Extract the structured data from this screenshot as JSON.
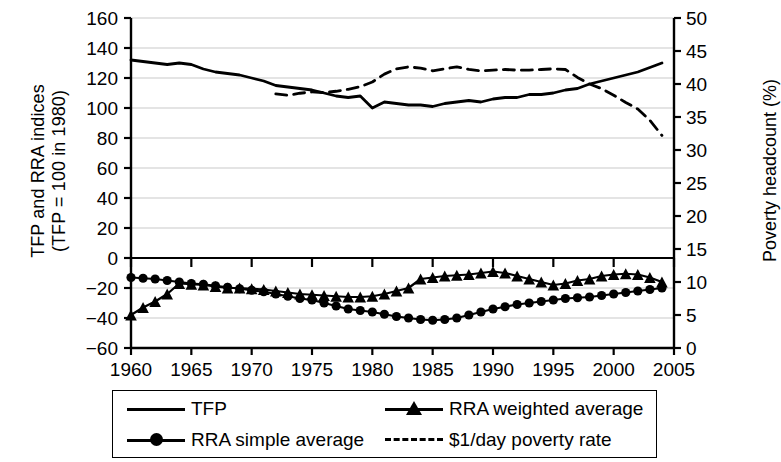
{
  "figure": {
    "axis_left_label": "TFP and RRA indices\n(TFP = 100 in 1980)",
    "axis_left_label_line1": "TFP and RRA indices",
    "axis_left_label_line2": "(TFP = 100 in 1980)",
    "axis_right_label": "Poverty headcount (%)"
  },
  "legend": {
    "items": [
      {
        "label": "TFP",
        "marker": "none",
        "dash": false
      },
      {
        "label": "RRA weighted average",
        "marker": "triangle",
        "dash": false
      },
      {
        "label": "RRA simple average",
        "marker": "circle",
        "dash": false
      },
      {
        "label": "$1/day poverty rate",
        "marker": "none",
        "dash": true
      }
    ]
  },
  "chart_data": {
    "type": "line",
    "title": "",
    "xlabel": "",
    "ylabel": "TFP and RRA indices (TFP = 100 in 1980)",
    "y2label": "Poverty headcount (%)",
    "xlim": [
      1960,
      2005
    ],
    "ylim": [
      -60,
      160
    ],
    "y2lim": [
      0,
      50
    ],
    "yticks": [
      -60,
      -40,
      -20,
      0,
      20,
      40,
      60,
      80,
      100,
      120,
      140,
      160
    ],
    "y2ticks": [
      0,
      5,
      10,
      15,
      20,
      25,
      30,
      35,
      40,
      45,
      50
    ],
    "xticks": [
      1960,
      1965,
      1970,
      1975,
      1980,
      1985,
      1990,
      1995,
      2000,
      2005
    ],
    "grid": true,
    "legend_position": "below",
    "series": [
      {
        "name": "TFP",
        "axis": "left",
        "style": "solid",
        "marker": "none",
        "color": "#000000",
        "x": [
          1960,
          1961,
          1962,
          1963,
          1964,
          1965,
          1966,
          1967,
          1968,
          1969,
          1970,
          1971,
          1972,
          1973,
          1974,
          1975,
          1976,
          1977,
          1978,
          1979,
          1980,
          1981,
          1982,
          1983,
          1984,
          1985,
          1986,
          1987,
          1988,
          1989,
          1990,
          1991,
          1992,
          1993,
          1994,
          1995,
          1996,
          1997,
          1998,
          1999,
          2000,
          2001,
          2002,
          2003,
          2004
        ],
        "y": [
          132,
          131,
          130,
          129,
          130,
          129,
          126,
          124,
          123,
          122,
          120,
          118,
          115,
          114,
          113,
          112,
          110,
          108,
          107,
          108,
          100,
          104,
          103,
          102,
          102,
          101,
          103,
          104,
          105,
          104,
          106,
          107,
          107,
          109,
          109,
          110,
          112,
          113,
          116,
          118,
          120,
          122,
          124,
          127,
          130
        ]
      },
      {
        "name": "$1/day poverty rate",
        "axis": "right",
        "style": "dashed",
        "marker": "none",
        "color": "#000000",
        "x": [
          1972,
          1973,
          1974,
          1975,
          1976,
          1977,
          1978,
          1979,
          1980,
          1981,
          1982,
          1983,
          1984,
          1985,
          1986,
          1987,
          1988,
          1989,
          1990,
          1991,
          1992,
          1993,
          1994,
          1995,
          1996,
          1997,
          1998,
          1999,
          2000,
          2001,
          2002,
          2003,
          2004
        ],
        "y": [
          38.5,
          38.3,
          38.6,
          38.8,
          38.7,
          38.9,
          39.2,
          39.6,
          40.3,
          41.5,
          42.3,
          42.6,
          42.4,
          42.0,
          42.3,
          42.6,
          42.2,
          42.0,
          42.1,
          42.2,
          42.1,
          42.1,
          42.2,
          42.3,
          42.2,
          41.0,
          40.0,
          39.3,
          38.3,
          37.2,
          36.2,
          34.5,
          32.2
        ]
      },
      {
        "name": "RRA simple average",
        "axis": "left",
        "style": "solid",
        "marker": "circle",
        "color": "#000000",
        "x": [
          1960,
          1961,
          1962,
          1963,
          1964,
          1965,
          1966,
          1967,
          1968,
          1969,
          1970,
          1971,
          1972,
          1973,
          1974,
          1975,
          1976,
          1977,
          1978,
          1979,
          1980,
          1981,
          1982,
          1983,
          1984,
          1985,
          1986,
          1987,
          1988,
          1989,
          1990,
          1991,
          1992,
          1993,
          1994,
          1995,
          1996,
          1997,
          1998,
          1999,
          2000,
          2001,
          2002,
          2003,
          2004
        ],
        "y": [
          -13,
          -13.5,
          -14,
          -15,
          -16,
          -17,
          -17.5,
          -18.5,
          -19.5,
          -20.5,
          -21.5,
          -22.5,
          -24,
          -25.5,
          -27,
          -28,
          -30,
          -32,
          -34,
          -35,
          -36,
          -37.5,
          -39,
          -40,
          -41,
          -41.5,
          -41,
          -40,
          -38,
          -36,
          -34,
          -32.5,
          -31,
          -30,
          -29,
          -28,
          -27,
          -26.5,
          -26,
          -25,
          -24,
          -23,
          -22,
          -21,
          -20
        ]
      },
      {
        "name": "RRA weighted average",
        "axis": "left",
        "style": "solid",
        "marker": "triangle",
        "color": "#000000",
        "x": [
          1960,
          1961,
          1962,
          1963,
          1964,
          1965,
          1966,
          1967,
          1968,
          1969,
          1970,
          1971,
          1972,
          1973,
          1974,
          1975,
          1976,
          1977,
          1978,
          1979,
          1980,
          1981,
          1982,
          1983,
          1984,
          1985,
          1986,
          1987,
          1988,
          1989,
          1990,
          1991,
          1992,
          1993,
          1994,
          1995,
          1996,
          1997,
          1998,
          1999,
          2000,
          2001,
          2002,
          2003,
          2004
        ],
        "y": [
          -38,
          -33,
          -29,
          -24,
          -17,
          -17.5,
          -18,
          -19,
          -20,
          -20,
          -20.5,
          -21,
          -22,
          -23,
          -24,
          -24.5,
          -25,
          -25.5,
          -26,
          -26,
          -25.5,
          -24,
          -22,
          -20,
          -14,
          -13,
          -12,
          -11.5,
          -11,
          -10,
          -9,
          -10,
          -12,
          -14,
          -16,
          -18,
          -17,
          -15,
          -14,
          -12,
          -11,
          -10.5,
          -11,
          -13,
          -16
        ]
      }
    ]
  }
}
